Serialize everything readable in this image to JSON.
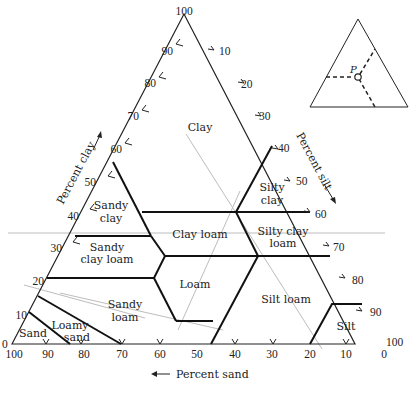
{
  "diagram": {
    "apex_label": "100",
    "axes": {
      "clay": {
        "label": "Percent clay",
        "ticks": [
          "0",
          "10",
          "20",
          "30",
          "40",
          "50",
          "60",
          "70",
          "80",
          "90",
          "100"
        ]
      },
      "silt": {
        "label": "Percent silt",
        "ticks": [
          "10",
          "20",
          "30",
          "40",
          "50",
          "60",
          "70",
          "80",
          "90",
          "100"
        ]
      },
      "sand": {
        "label": "Percent sand",
        "ticks": [
          "100",
          "90",
          "80",
          "70",
          "60",
          "50",
          "40",
          "30",
          "20",
          "10",
          "0"
        ]
      }
    },
    "regions": [
      {
        "name": "Clay",
        "lines": [
          "Clay"
        ]
      },
      {
        "name": "Sandy clay",
        "lines": [
          "Sandy",
          "clay"
        ]
      },
      {
        "name": "Silty clay",
        "lines": [
          "Silty",
          "clay"
        ]
      },
      {
        "name": "Sandy clay loam",
        "lines": [
          "Sandy",
          "clay loam"
        ]
      },
      {
        "name": "Clay loam",
        "lines": [
          "Clay loam"
        ]
      },
      {
        "name": "Silty clay loam",
        "lines": [
          "Silty clay",
          "loam"
        ]
      },
      {
        "name": "Loam",
        "lines": [
          "Loam"
        ]
      },
      {
        "name": "Sandy loam",
        "lines": [
          "Sandy",
          "loam"
        ]
      },
      {
        "name": "Loamy sand",
        "lines": [
          "Loamy",
          "sand"
        ]
      },
      {
        "name": "Sand",
        "lines": [
          "Sand"
        ]
      },
      {
        "name": "Silt loam",
        "lines": [
          "Silt loam"
        ]
      },
      {
        "name": "Silt",
        "lines": [
          "Silt"
        ]
      }
    ],
    "inset": {
      "point_label": "P"
    }
  }
}
